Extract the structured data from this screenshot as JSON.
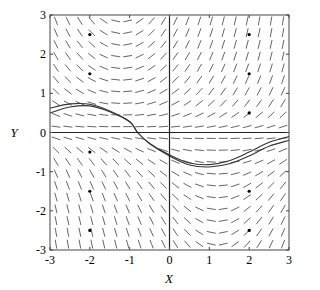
{
  "figure": {
    "xlabel": "X",
    "ylabel": "Y",
    "xlim": [
      -3,
      3
    ],
    "ylim": [
      -3,
      3
    ],
    "xticks": [
      "-3",
      "-2",
      "-1",
      "0",
      "1",
      "2",
      "3"
    ],
    "yticks": [
      "-3",
      "-2",
      "-1",
      "0",
      "1",
      "2",
      "3"
    ],
    "colors": {
      "segments": "#555555",
      "axes": "#222222",
      "curves": "#333333",
      "frame": "#444444"
    }
  },
  "plot_box": {
    "left": 50,
    "top": 15,
    "right": 289,
    "bottom": 250
  },
  "slope_field": {
    "grid_min": -2.85,
    "grid_max": 2.85,
    "grid_step": 0.3,
    "segment_length_px": 9
  },
  "marked_points": [
    [
      -2,
      2.5
    ],
    [
      -2,
      1.5
    ],
    [
      -2,
      -0.5
    ],
    [
      -2,
      -1.5
    ],
    [
      -2,
      -2.5
    ],
    [
      2,
      2.5
    ],
    [
      2,
      1.5
    ],
    [
      2,
      0.5
    ],
    [
      2,
      -1.5
    ],
    [
      2,
      -2.5
    ]
  ],
  "solution_curves": [
    {
      "name": "solution-curve-1",
      "points": [
        [
          -3,
          0.62
        ],
        [
          -2.5,
          0.73
        ],
        [
          -2,
          0.72
        ],
        [
          -1.5,
          0.55
        ],
        [
          -1,
          0.28
        ],
        [
          -0.8,
          0.0
        ],
        [
          -0.5,
          -0.28
        ],
        [
          0,
          -0.57
        ],
        [
          0.5,
          -0.78
        ],
        [
          1,
          -0.82
        ],
        [
          1.5,
          -0.72
        ],
        [
          2,
          -0.5
        ],
        [
          2.5,
          -0.25
        ],
        [
          3,
          -0.1
        ]
      ]
    },
    {
      "name": "solution-curve-2",
      "points": [
        [
          -3,
          0.5
        ],
        [
          -2.5,
          0.65
        ],
        [
          -2,
          0.68
        ],
        [
          -1.5,
          0.53
        ],
        [
          -1,
          0.27
        ],
        [
          -0.8,
          0.0
        ],
        [
          -0.5,
          -0.28
        ],
        [
          0,
          -0.6
        ],
        [
          0.5,
          -0.83
        ],
        [
          1,
          -0.88
        ],
        [
          1.5,
          -0.8
        ],
        [
          2,
          -0.6
        ],
        [
          2.5,
          -0.35
        ],
        [
          3,
          -0.2
        ]
      ]
    }
  ]
}
